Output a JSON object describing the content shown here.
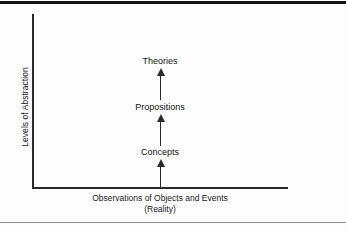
{
  "figure": {
    "axes": {
      "y_label": "Levels of Abstraction",
      "x_label_line1": "Observations of Objects and Events",
      "x_label_line2": "(Reality)"
    },
    "levels": [
      {
        "label": "Theories"
      },
      {
        "label": "Propositions"
      },
      {
        "label": "Concepts"
      }
    ],
    "arrows": [
      {
        "name": "propositions-to-theories"
      },
      {
        "name": "concepts-to-propositions"
      },
      {
        "name": "observations-to-concepts"
      }
    ],
    "colors": {
      "ink": "#1a1a1a",
      "line": "#2b2b2b",
      "rule_top": "#121212",
      "rule_bottom": "#8e8e8e",
      "background": "#fdfdfd"
    }
  }
}
